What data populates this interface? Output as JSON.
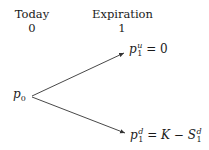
{
  "columns": [
    {
      "label": "Today",
      "time": "0"
    },
    {
      "label": "Expiration",
      "time": "1"
    }
  ],
  "nodes": {
    "root": {
      "base": "p",
      "sub": "0"
    },
    "up": {
      "base": "p",
      "sup": "u",
      "sub": "1",
      "eq": "=",
      "rhs": "0"
    },
    "down": {
      "base": "p",
      "sup": "d",
      "sub": "1",
      "eq": "=",
      "rhs_k": "K",
      "minus": "−",
      "rhs_s": "S",
      "rhs_s_sup": "d",
      "rhs_s_sub": "1"
    }
  },
  "edges": [
    {
      "from": "root",
      "to": "up"
    },
    {
      "from": "root",
      "to": "down"
    }
  ],
  "colors": {
    "line": "#333333",
    "text": "#1a1a1a"
  }
}
